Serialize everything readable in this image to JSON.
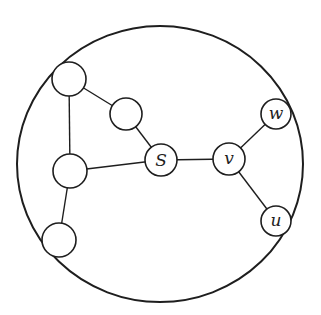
{
  "diagram": {
    "type": "graph",
    "boundary": {
      "cx": 160,
      "cy": 164,
      "rx": 143,
      "ry": 138
    },
    "nodes": [
      {
        "id": "n1",
        "label": "",
        "cx": 69,
        "cy": 79,
        "r": 17
      },
      {
        "id": "n2",
        "label": "",
        "cx": 126,
        "cy": 114,
        "r": 16
      },
      {
        "id": "n3",
        "label": "",
        "cx": 70,
        "cy": 171,
        "r": 17
      },
      {
        "id": "n4",
        "label": "",
        "cx": 59,
        "cy": 240,
        "r": 17
      },
      {
        "id": "S",
        "label": "S",
        "cx": 161,
        "cy": 160,
        "r": 16
      },
      {
        "id": "v",
        "label": "v",
        "cx": 229,
        "cy": 159,
        "r": 16
      },
      {
        "id": "w",
        "label": "w",
        "cx": 276,
        "cy": 114,
        "r": 15
      },
      {
        "id": "u",
        "label": "u",
        "cx": 276,
        "cy": 221,
        "r": 15
      }
    ],
    "edges": [
      [
        "n1",
        "n2"
      ],
      [
        "n1",
        "n3"
      ],
      [
        "n2",
        "S"
      ],
      [
        "n3",
        "S"
      ],
      [
        "n3",
        "n4"
      ],
      [
        "S",
        "v"
      ],
      [
        "v",
        "w"
      ],
      [
        "v",
        "u"
      ]
    ]
  },
  "labels": {
    "S": "S",
    "v": "v",
    "w": "w",
    "u": "u"
  }
}
